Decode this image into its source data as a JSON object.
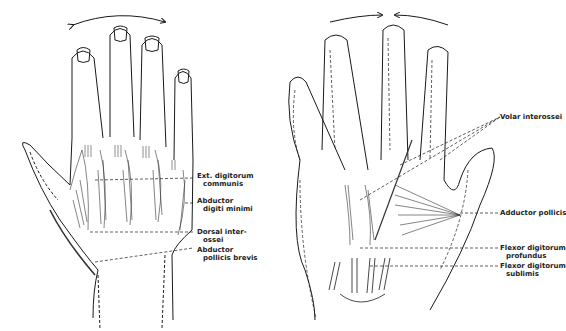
{
  "figure": {
    "left_panel": {
      "view": "dorsal",
      "labels": [
        {
          "id": "ext-digitorum",
          "line1": "Ext. digitorum",
          "line2": "communis"
        },
        {
          "id": "abductor-digiti",
          "line1": "Abductor",
          "line2": "digiti minimi"
        },
        {
          "id": "dorsal-interossei",
          "line1": "Dorsal inter-",
          "line2": "ossei"
        },
        {
          "id": "abductor-pollicis-brevis",
          "line1": "Abductor",
          "line2": "pollicis brevis"
        }
      ],
      "motion_arrow": "abduction (fingers spreading apart)"
    },
    "right_panel": {
      "view": "palmar",
      "labels": [
        {
          "id": "volar-interossei",
          "line1": "Volar interossei",
          "line2": ""
        },
        {
          "id": "adductor-pollicis",
          "line1": "Adductor pollicis",
          "line2": ""
        },
        {
          "id": "flexor-profundus",
          "line1": "Flexor digitorum",
          "line2": "profundus"
        },
        {
          "id": "flexor-sublimis",
          "line1": "Flexor digitorum",
          "line2": "sublimis"
        }
      ],
      "motion_arrow": "adduction (fingers moving together)"
    },
    "colors": {
      "ink": "#1a1a1a",
      "background": "#ffffff"
    }
  }
}
